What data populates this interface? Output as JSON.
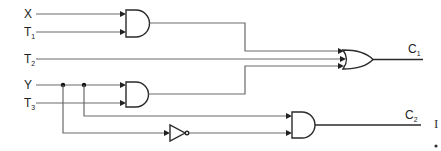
{
  "diagram": {
    "type": "logic-circuit",
    "inputs": [
      {
        "name": "X",
        "sub": ""
      },
      {
        "name": "T",
        "sub": "1"
      },
      {
        "name": "T",
        "sub": "2"
      },
      {
        "name": "Y",
        "sub": ""
      },
      {
        "name": "T",
        "sub": "3"
      }
    ],
    "outputs": [
      {
        "name": "C",
        "sub": "1"
      },
      {
        "name": "C",
        "sub": "2"
      }
    ],
    "gates": [
      {
        "id": "and1",
        "type": "AND",
        "inputs": [
          "X",
          "T1"
        ]
      },
      {
        "id": "and2",
        "type": "AND",
        "inputs": [
          "Y",
          "T3"
        ]
      },
      {
        "id": "or1",
        "type": "OR",
        "inputs": [
          "and1",
          "T2",
          "and2"
        ],
        "output": "C1"
      },
      {
        "id": "not1",
        "type": "NOT",
        "inputs": [
          "Y"
        ]
      },
      {
        "id": "and3",
        "type": "AND",
        "inputs": [
          "Y",
          "not1"
        ],
        "output": "C2"
      }
    ],
    "edge_fragments": [
      "I",
      "."
    ]
  }
}
